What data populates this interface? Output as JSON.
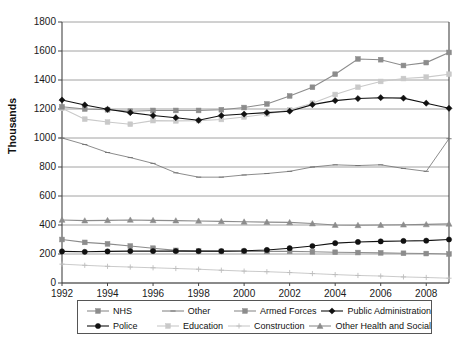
{
  "chart_data": {
    "type": "line",
    "title": "",
    "xlabel": "",
    "ylabel": "Thousands",
    "xlim": [
      1992,
      2009
    ],
    "ylim": [
      0,
      1800
    ],
    "ytick_step": 200,
    "yticks": [
      0,
      200,
      400,
      600,
      800,
      1000,
      1200,
      1400,
      1600,
      1800
    ],
    "xticks": [
      1992,
      1994,
      1996,
      1998,
      2000,
      2002,
      2004,
      2006,
      2008
    ],
    "x": [
      1992,
      1993,
      1994,
      1995,
      1996,
      1997,
      1998,
      1999,
      2000,
      2001,
      2002,
      2003,
      2004,
      2005,
      2006,
      2007,
      2008,
      2009
    ],
    "grid": true,
    "legend_position": "bottom",
    "series": [
      {
        "name": "NHS",
        "color": "#8c8c8c",
        "marker": "square",
        "values": [
          1215,
          1200,
          1195,
          1185,
          1190,
          1190,
          1190,
          1195,
          1210,
          1235,
          1290,
          1350,
          1440,
          1545,
          1540,
          1500,
          1520,
          1590
        ]
      },
      {
        "name": "Police",
        "color": "#111111",
        "marker": "circle",
        "values": [
          218,
          215,
          218,
          220,
          220,
          220,
          220,
          220,
          222,
          228,
          240,
          255,
          275,
          283,
          287,
          290,
          292,
          300
        ]
      },
      {
        "name": "Other",
        "color": "#6e6e6e",
        "marker": "dash",
        "values": [
          1000,
          955,
          900,
          865,
          825,
          760,
          730,
          730,
          745,
          755,
          770,
          800,
          815,
          810,
          815,
          790,
          770,
          995
        ]
      },
      {
        "name": "Education",
        "color": "#c9c9c9",
        "marker": "square-light",
        "values": [
          1205,
          1130,
          1110,
          1095,
          1120,
          1118,
          1120,
          1128,
          1145,
          1165,
          1195,
          1240,
          1300,
          1350,
          1390,
          1410,
          1420,
          1440
        ]
      },
      {
        "name": "Armed Forces",
        "color": "#8c8c8c",
        "marker": "square",
        "values": [
          300,
          280,
          270,
          255,
          240,
          225,
          220,
          218,
          218,
          218,
          218,
          215,
          212,
          210,
          208,
          205,
          203,
          200
        ]
      },
      {
        "name": "Construction",
        "color": "#bdbdbd",
        "marker": "plus",
        "values": [
          130,
          122,
          115,
          110,
          105,
          100,
          95,
          88,
          82,
          78,
          72,
          65,
          58,
          52,
          48,
          42,
          38,
          33
        ]
      },
      {
        "name": "Public Administration",
        "color": "#111111",
        "marker": "diamond",
        "values": [
          1262,
          1228,
          1198,
          1175,
          1155,
          1140,
          1122,
          1155,
          1165,
          1175,
          1185,
          1230,
          1258,
          1272,
          1278,
          1275,
          1240,
          1205
        ]
      },
      {
        "name": "Other Health and Social",
        "color": "#8c8c8c",
        "marker": "triangle",
        "values": [
          435,
          430,
          432,
          435,
          432,
          430,
          428,
          425,
          422,
          420,
          418,
          410,
          400,
          398,
          400,
          402,
          404,
          408
        ]
      }
    ],
    "legend_rows": [
      [
        "NHS",
        "Other",
        "Armed Forces",
        "Public Administration"
      ],
      [
        "Police",
        "Education",
        "Construction",
        "Other Health and Social"
      ]
    ]
  }
}
